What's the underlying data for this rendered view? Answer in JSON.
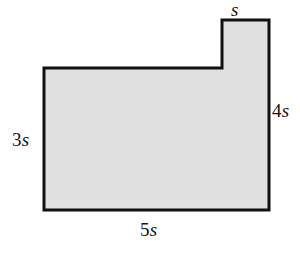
{
  "figure": {
    "name": "notched-rectangle-dimension-figure",
    "shape_type": "L-shaped polygon (rectangle with top-left notch removed)",
    "fill_color": "#e0e0e0",
    "stroke_color": "#111111",
    "background_color": "#ffffff",
    "stroke_width": 3,
    "vertices": [
      [
        44,
        68
      ],
      [
        222,
        68
      ],
      [
        222,
        20
      ],
      [
        269,
        20
      ],
      [
        269,
        210
      ],
      [
        44,
        210
      ]
    ],
    "labels": {
      "top": {
        "number": "",
        "variable": "s"
      },
      "right": {
        "number": "4",
        "variable": "s"
      },
      "left": {
        "number": "3",
        "variable": "s"
      },
      "bottom": {
        "number": "5",
        "variable": "s"
      }
    }
  }
}
